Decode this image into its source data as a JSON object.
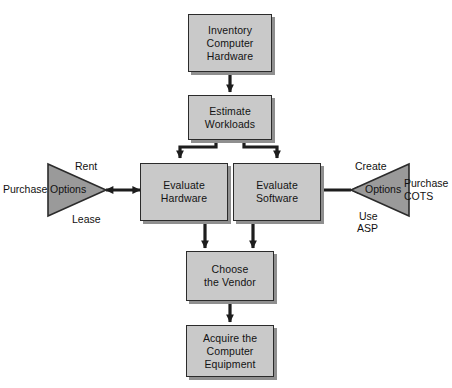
{
  "figure": {
    "caption_fragment": "Hardware and Software",
    "background_color": "#ffffff",
    "box_fill": "#c9c9c9",
    "box_border": "#2b2b2b",
    "shadow_color": "#8f8f8f",
    "triangle_fill": "#9a9a9a",
    "triangle_border": "#2b2b2b",
    "arrow_color": "#1d1d1d"
  },
  "nodes": {
    "inventory": {
      "label": "Inventory\nComputer\nHardware",
      "lines": [
        "Inventory",
        "Computer",
        "Hardware"
      ]
    },
    "estimate": {
      "label": "Estimate\nWorkloads",
      "lines": [
        "Estimate",
        "Workloads"
      ]
    },
    "evaluate_hardware": {
      "label": "Evaluate\nHardware",
      "lines": [
        "Evaluate",
        "Hardware"
      ]
    },
    "evaluate_software": {
      "label": "Evaluate\nSoftware",
      "lines": [
        "Evaluate",
        "Software"
      ]
    },
    "choose_vendor": {
      "label": "Choose\nthe Vendor",
      "lines": [
        "Choose",
        "the Vendor"
      ]
    },
    "acquire": {
      "label": "Acquire the\nComputer\nEquipment",
      "lines": [
        "Acquire the",
        "Computer",
        "Equipment"
      ]
    }
  },
  "options_left": {
    "inner_label": "Options",
    "top_label": "Rent",
    "bottom_label": "Lease",
    "outer_label": "Purchase"
  },
  "options_right": {
    "inner_label": "Options",
    "top_label": "Create",
    "bottom_label_line1": "Use",
    "bottom_label_line2": "ASP",
    "outer_label_line1": "Purchase",
    "outer_label_line2": "COTS"
  },
  "connectors": [
    {
      "name": "inventory-to-estimate",
      "type": "arrow-down"
    },
    {
      "name": "estimate-to-evaluate-hardware",
      "type": "arrow-down"
    },
    {
      "name": "estimate-to-evaluate-software",
      "type": "arrow-down"
    },
    {
      "name": "options-left-to-evaluate-hardware",
      "type": "arrow-double-horizontal"
    },
    {
      "name": "options-right-to-evaluate-software",
      "type": "arrow-double-horizontal"
    },
    {
      "name": "evaluate-hardware-to-choose-vendor",
      "type": "arrow-down"
    },
    {
      "name": "evaluate-software-to-choose-vendor",
      "type": "arrow-down"
    },
    {
      "name": "choose-vendor-to-acquire",
      "type": "arrow-down"
    }
  ]
}
